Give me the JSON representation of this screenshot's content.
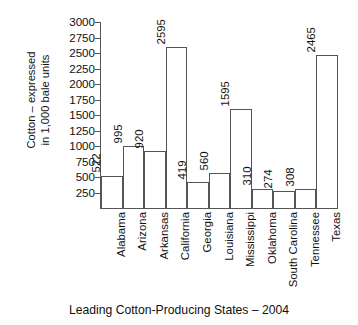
{
  "chart_data": {
    "type": "bar",
    "title": "",
    "xlabel": "Leading Cotton-Producing States – 2004",
    "ylabel_lines": [
      "Cotton – expressed",
      "in 1,000 bale units"
    ],
    "ylabel": "Cotton – expressed in 1,000 bale units",
    "categories": [
      "Alabama",
      "Arizona",
      "Arkansas",
      "California",
      "Georgia",
      "Louisiana",
      "Mississippi",
      "Oklahoma",
      "South Carolina",
      "Tennessee",
      "Texas"
    ],
    "values": [
      522,
      995,
      920,
      2595,
      419,
      560,
      1595,
      310,
      274,
      308,
      2465
    ],
    "value_labels": [
      "522",
      "995",
      "920",
      "2595",
      "419",
      "560",
      "1595",
      "310",
      "274",
      "308",
      "2465"
    ],
    "ylim": [
      0,
      3000
    ],
    "ytick_values": [
      250,
      500,
      750,
      1000,
      1250,
      1500,
      1750,
      2000,
      2250,
      2500,
      2750,
      3000
    ],
    "ytick_labels": [
      "250",
      "500",
      "750",
      "1000",
      "1250",
      "1500",
      "1750",
      "2000",
      "2250",
      "2500",
      "2750",
      "3000"
    ],
    "grid": false,
    "legend": false,
    "bar_fill_color": "#ffffff",
    "bar_edge_color": "#555555",
    "axis_color": "#555555",
    "text_color": "#111111",
    "background_color": "#ffffff"
  }
}
